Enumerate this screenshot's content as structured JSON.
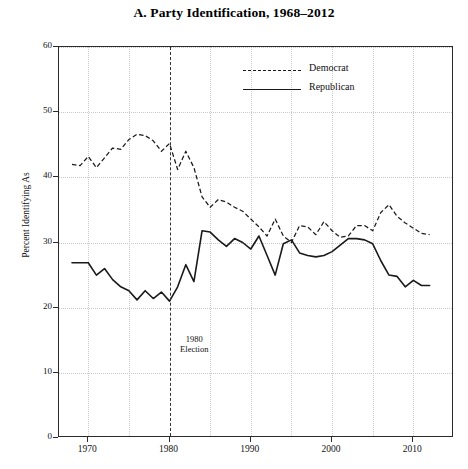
{
  "chart_data": {
    "type": "line",
    "title": "A. Party Identification, 1968–2012",
    "xlabel": "",
    "ylabel": "Percent Identifying As",
    "xlim": [
      1966.4,
      2015.0
    ],
    "ylim": [
      0,
      60
    ],
    "grid": true,
    "legend_position": "top-center",
    "xticks": [
      1970,
      1980,
      1990,
      2000,
      2010
    ],
    "xtick_labels": [
      "1970",
      "1980",
      "1990",
      "2000",
      "2010"
    ],
    "xminor_gridlines": [
      1975,
      1985,
      1995,
      2005
    ],
    "yticks": [
      0,
      10,
      20,
      30,
      40,
      50,
      60
    ],
    "ytick_labels": [
      "0",
      "10",
      "20",
      "30",
      "40",
      "50",
      "60"
    ],
    "annotations": [
      {
        "name": "election-marker",
        "type": "vline",
        "x": 1980,
        "style": "dashed",
        "label": "1980\nElection",
        "label_line1": "1980",
        "label_line2": "Election",
        "label_x": 1981.3,
        "label_y": 14.5
      }
    ],
    "x": [
      1968,
      1969,
      1970,
      1971,
      1972,
      1973,
      1974,
      1975,
      1976,
      1977,
      1978,
      1979,
      1980,
      1981,
      1982,
      1983,
      1984,
      1985,
      1986,
      1987,
      1988,
      1989,
      1990,
      1991,
      1992,
      1993,
      1994,
      1995,
      1996,
      1997,
      1998,
      1999,
      2000,
      2001,
      2002,
      2003,
      2004,
      2005,
      2006,
      2007,
      2008,
      2009,
      2010,
      2011,
      2012
    ],
    "series": [
      {
        "name": "Democrat",
        "style": "dashed",
        "color": "#1a1a1a",
        "values": [
          42.0,
          41.8,
          43.2,
          41.5,
          43.0,
          44.5,
          44.3,
          45.8,
          46.6,
          46.4,
          45.6,
          44.0,
          45.2,
          41.2,
          44.0,
          41.5,
          37.0,
          35.4,
          36.6,
          36.2,
          35.4,
          34.8,
          33.6,
          32.4,
          31.0,
          33.6,
          31.0,
          30.0,
          32.6,
          32.4,
          31.2,
          33.2,
          31.8,
          30.8,
          31.0,
          32.6,
          32.6,
          31.8,
          34.6,
          35.8,
          34.0,
          33.0,
          32.2,
          31.4,
          31.2
        ]
      },
      {
        "name": "Republican",
        "style": "solid",
        "color": "#1a1a1a",
        "values": [
          26.9,
          26.9,
          26.9,
          25.0,
          26.0,
          24.3,
          23.2,
          22.6,
          21.2,
          22.6,
          21.4,
          22.4,
          21.0,
          23.2,
          26.6,
          24.0,
          31.8,
          31.6,
          30.4,
          29.4,
          30.6,
          30.0,
          29.0,
          31.0,
          28.0,
          25.0,
          29.8,
          30.4,
          28.4,
          28.0,
          27.8,
          28.0,
          28.6,
          29.6,
          30.6,
          30.6,
          30.4,
          29.8,
          27.2,
          25.0,
          24.8,
          23.2,
          24.2,
          23.4,
          23.4
        ]
      }
    ]
  },
  "legend": {
    "items": [
      {
        "label": "Democrat",
        "style": "dem"
      },
      {
        "label": "Republican",
        "style": "rep"
      }
    ]
  }
}
